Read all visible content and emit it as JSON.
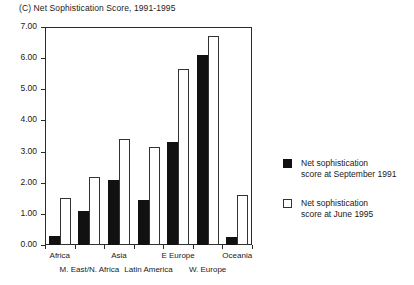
{
  "chart_data": {
    "type": "bar",
    "title": "(C) Net Sophistication Score, 1991-1995",
    "xlabel": "",
    "ylabel": "",
    "ylim": [
      0,
      7
    ],
    "ytick_step": 1,
    "ytick_labels": [
      "0.00",
      "1.00",
      "2.00",
      "3.00",
      "4.00",
      "5.00",
      "6.00",
      "7.00"
    ],
    "grid": false,
    "legend_position": "right",
    "categories": [
      "Africa",
      "M. East/N. Africa",
      "Asia",
      "Latin America",
      "E Europe",
      "W. Europe",
      "Oceania"
    ],
    "category_label_row": [
      0,
      1,
      0,
      1,
      0,
      1,
      0
    ],
    "series": [
      {
        "name": "Net sophistication score at September 1991",
        "values": [
          0.3,
          1.1,
          2.1,
          1.45,
          3.3,
          6.1,
          0.25
        ],
        "color": "#111111",
        "style": "filled"
      },
      {
        "name": "Net sophistication score at June 1995",
        "values": [
          1.5,
          2.2,
          3.4,
          3.15,
          5.65,
          6.7,
          1.6
        ],
        "color": "#ffffff",
        "style": "hollow"
      }
    ]
  },
  "legend": {
    "items": [
      {
        "line1": "Net sophistication",
        "line2": "score at September 1991"
      },
      {
        "line1": "Net sophistication",
        "line2": "score at June 1995"
      }
    ]
  }
}
